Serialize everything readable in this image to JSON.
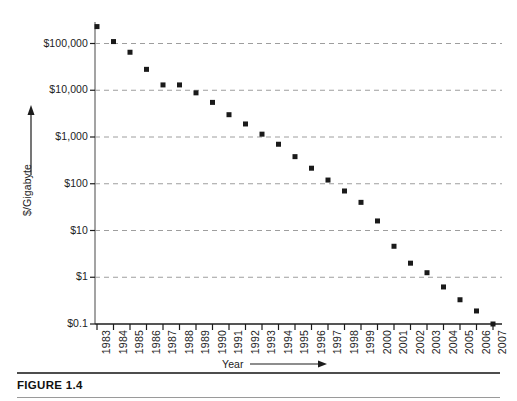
{
  "figure": {
    "caption_label": "FIGURE 1.4"
  },
  "chart_data": {
    "type": "scatter",
    "title": "",
    "xlabel": "Year",
    "ylabel": "$/Gigabyte",
    "x_axis_arrow": true,
    "y_axis_arrow": true,
    "yscale": "log",
    "ylim": [
      0.1,
      1000000
    ],
    "grid": true,
    "grid_axis": "y",
    "legend": "none",
    "y_ticks": [
      0.1,
      1,
      10,
      100,
      1000,
      10000,
      100000
    ],
    "y_tick_labels": [
      "$0.1",
      "$1",
      "$10",
      "$100",
      "$1,000",
      "$10,000",
      "$100,000"
    ],
    "categories": [
      "1983",
      "1984",
      "1985",
      "1986",
      "1987",
      "1988",
      "1989",
      "1990",
      "1991",
      "1992",
      "1993",
      "1994",
      "1995",
      "1996",
      "1997",
      "1998",
      "1999",
      "2000",
      "2001",
      "2002",
      "2003",
      "2004",
      "2005",
      "2006",
      "2007"
    ],
    "x": [
      1983,
      1984,
      1985,
      1986,
      1987,
      1988,
      1989,
      1990,
      1991,
      1992,
      1993,
      1994,
      1995,
      1996,
      1997,
      1998,
      1999,
      2000,
      2001,
      2002,
      2003,
      2004,
      2005,
      2006,
      2007
    ],
    "values": [
      230000,
      110000,
      65000,
      28000,
      13000,
      13000,
      8800,
      5500,
      3000,
      1900,
      1150,
      700,
      380,
      215,
      120,
      70,
      40,
      16,
      4.6,
      2.0,
      1.25,
      0.62,
      0.33,
      0.19,
      0.1
    ],
    "marker": "square",
    "marker_color": "#1a1a1a",
    "marker_size": 5,
    "axis_color": "#8c8c8c",
    "grid_color": "#9e9e9e"
  }
}
